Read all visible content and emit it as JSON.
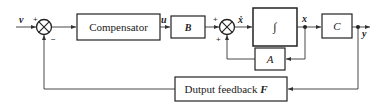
{
  "diagram": {
    "type": "block-diagram",
    "signals": {
      "input": "v",
      "control": "u",
      "state_derivative": "ẋ",
      "state": "x",
      "output": "y"
    },
    "blocks": {
      "compensator": "Compensator",
      "input_matrix": "B",
      "integrator": "∫",
      "output_matrix": "C",
      "system_matrix": "A",
      "feedback": "Dutput feedback",
      "feedback_symbol": "F"
    },
    "summing_junctions": [
      {
        "name": "sum-1",
        "signs": {
          "top_left": "+",
          "bottom": "−"
        }
      },
      {
        "name": "sum-2",
        "signs": {
          "top_left": "+",
          "bottom_left": "+"
        }
      }
    ]
  }
}
